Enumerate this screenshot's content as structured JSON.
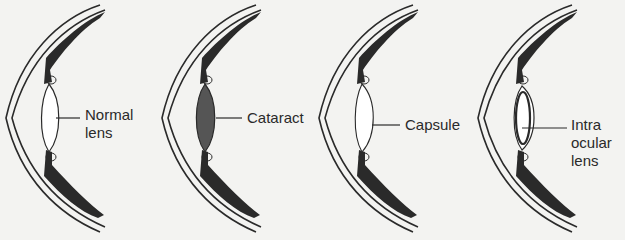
{
  "diagram": {
    "panels": [
      {
        "id": "normal",
        "label": "Normal\nlens",
        "lens": "clear",
        "label_x": 85,
        "label_y": 100
      },
      {
        "id": "cataract",
        "label": "Cataract",
        "lens": "opaque",
        "label_x": 247,
        "label_y": 109
      },
      {
        "id": "capsule",
        "label": "Capsule",
        "lens": "removed",
        "label_x": 405,
        "label_y": 115
      },
      {
        "id": "iol",
        "label": "Intra\nocular\nlens",
        "lens": "implant",
        "label_x": 571,
        "label_y": 115
      }
    ]
  },
  "colors": {
    "background": "#f3f3f1",
    "ink": "#2a2a2a",
    "cataract_fill": "#555555",
    "lens_fill": "#ffffff"
  }
}
